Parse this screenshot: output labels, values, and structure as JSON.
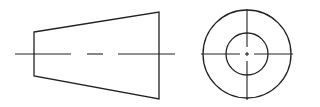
{
  "figure": {
    "type": "orthographic-projection",
    "stroke_color": "#222222",
    "background": "#ffffff",
    "front_view": {
      "left_edge": {
        "x": 34,
        "y_top": 32,
        "y_bottom": 76
      },
      "right_edge": {
        "x": 159,
        "y_top": 12,
        "y_bottom": 99
      },
      "center_line": {
        "y": 54,
        "x_start": 15,
        "x_end": 175,
        "dashes": [
          [
            15,
            71
          ],
          [
            87,
            103
          ],
          [
            118,
            175
          ]
        ]
      }
    },
    "side_view": {
      "center": {
        "x": 247,
        "y": 54
      },
      "outer_radius": 44,
      "inner_radius": 21,
      "center_lines": {
        "h": [
          201,
          293
        ],
        "v": [
          9,
          100
        ]
      }
    }
  }
}
